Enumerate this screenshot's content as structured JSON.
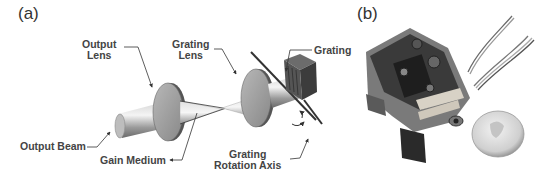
{
  "panels": {
    "a": {
      "label": "(a)"
    },
    "b": {
      "label": "(b)"
    }
  },
  "diagram": {
    "labels": {
      "output_lens_line1": "Output",
      "output_lens_line2": "Lens",
      "grating_lens_line1": "Grating",
      "grating_lens_line2": "Lens",
      "grating": "Grating",
      "output_beam": "Output Beam",
      "gain_medium": "Gain Medium",
      "rotation_axis_line1": "Grating",
      "rotation_axis_line2": "Rotation Axis"
    },
    "components": [
      "output-beam",
      "output-lens",
      "gain-medium",
      "grating-lens",
      "grating",
      "grating-rotation-axis"
    ]
  },
  "photo": {
    "subject": "assembled laser module next to a coin for scale",
    "objects": [
      "laser-module",
      "wires",
      "coin"
    ]
  }
}
